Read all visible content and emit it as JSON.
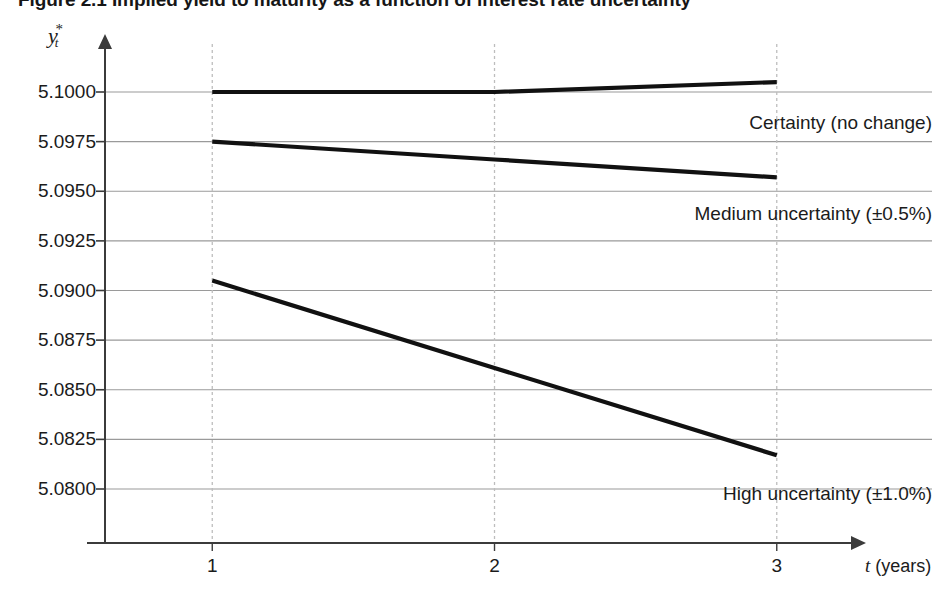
{
  "figure": {
    "number": "Figure 2.1",
    "title": "Implied yield to maturity as a function of interest rate uncertainty",
    "full_title": "Figure 2.1  Implied yield to maturity as a function of interest rate uncertainty"
  },
  "axis": {
    "y_label_base": "y",
    "y_label_sub": "t",
    "y_label_sup": "*",
    "x_label_var": "t",
    "x_label_unit": " (years)"
  },
  "chart_data": {
    "type": "line",
    "title": "Implied yield to maturity as a function of interest rate uncertainty",
    "xlabel": "t (years)",
    "ylabel": "y*_t",
    "xlim": [
      0.62,
      3.55
    ],
    "ylim": [
      5.07855,
      5.10105
    ],
    "x": [
      1,
      2,
      3
    ],
    "xtick_labels": [
      "1",
      "2",
      "3"
    ],
    "ytick_values": [
      5.1,
      5.0975,
      5.095,
      5.0925,
      5.09,
      5.0875,
      5.085,
      5.0825,
      5.08
    ],
    "ytick_labels": [
      "5.1000",
      "5.0975",
      "5.0950",
      "5.0925",
      "5.0900",
      "5.0875",
      "5.0850",
      "5.0825",
      "5.0800"
    ],
    "grid": true,
    "grid_axis": "y",
    "legend": "inline-right-of-series",
    "series": [
      {
        "name": "Certainty (no change)",
        "values": [
          5.1,
          5.1,
          5.1005
        ],
        "color": "#111111",
        "label_x": 3.1,
        "label_y": 5.0984
      },
      {
        "name": "Medium uncertainty (±0.5%)",
        "values": [
          5.0975,
          5.0966,
          5.0957
        ],
        "color": "#111111",
        "label_x": 3.1,
        "label_y": 5.0938
      },
      {
        "name": "High uncertainty (±1.0%)",
        "values": [
          5.0905,
          5.0861,
          5.0817
        ],
        "color": "#111111",
        "label_x": 3.1,
        "label_y": 5.0797
      }
    ]
  },
  "colors": {
    "line": "#111111",
    "grid": "#9a9a9a",
    "axis": "#3b3b3b",
    "vertical_guide": "#bdbdbd",
    "text": "#1b1b1b"
  }
}
